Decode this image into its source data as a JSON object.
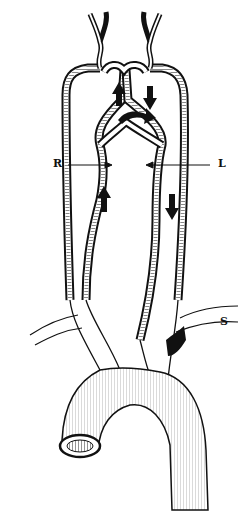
{
  "figure": {
    "labels": {
      "right": "R",
      "left": "L",
      "subclavian": "S"
    },
    "colors": {
      "ink": "#111111",
      "background": "#ffffff"
    },
    "flow_arrows": [
      {
        "id": "up-left-upper",
        "direction": "up"
      },
      {
        "id": "down-right-upper",
        "direction": "down"
      },
      {
        "id": "curved-right-middle",
        "direction": "right"
      },
      {
        "id": "up-left-lower",
        "direction": "up"
      },
      {
        "id": "down-right-lower",
        "direction": "down"
      }
    ]
  }
}
